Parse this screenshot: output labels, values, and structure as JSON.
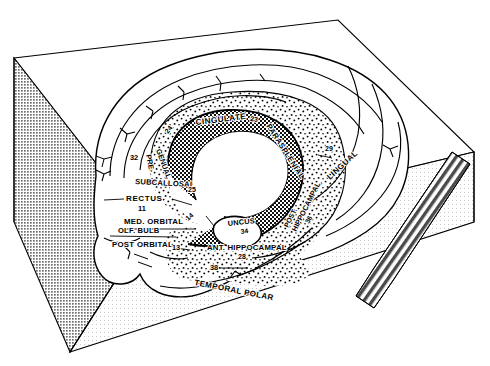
{
  "figure": {
    "kind": "anatomical-line-diagram",
    "view": "three-dimensional block with medial brain surface on top face",
    "colors": {
      "ink": "#000000",
      "paper": "#ffffff",
      "left_face_shade": "#9a9a9a",
      "right_face_shade": "#efefef",
      "top_face": "#ffffff",
      "stipple": "#000000",
      "crosshatch": "#000000"
    }
  },
  "block": {
    "left_face": "shaded-gray-wedge",
    "right_face": "light-gray-wedge",
    "top_face": "white",
    "stair_band": "diagonal-striped-ladder-band-on-right-face"
  },
  "legend_note": {
    "stipple_region": "limbic cortex (stippled)",
    "crosshatch_region": "periallocortex / corpus callosum border (cross-hatched)",
    "plain_region": "neocortex (unmarked)"
  },
  "labels": [
    {
      "id": "cingulate",
      "text": "CINGULATE",
      "x": 196,
      "y": 125,
      "rot": -7,
      "size": 8.2,
      "letter_spacing": 0.4
    },
    {
      "id": "area-24",
      "text": "24",
      "x": 168,
      "y": 134,
      "rot": -52,
      "size": 7.0
    },
    {
      "id": "area-23",
      "text": "23",
      "x": 250,
      "y": 121,
      "rot": 6,
      "size": 7.0
    },
    {
      "id": "parasplenial",
      "text": "PARASPLENIAL",
      "x": 266,
      "y": 126,
      "rot": 57,
      "size": 7.8,
      "letter_spacing": 0.3
    },
    {
      "id": "area-29",
      "text": "29",
      "x": 325,
      "y": 151,
      "rot": 0,
      "size": 7.0
    },
    {
      "id": "lingual",
      "text": "LINGUAL",
      "x": 330,
      "y": 180,
      "rot": -43,
      "size": 8.0,
      "letter_spacing": 0.4
    },
    {
      "id": "area-32",
      "text": "32",
      "x": 130,
      "y": 160,
      "rot": 0,
      "size": 7.4
    },
    {
      "id": "pre",
      "text": "PRE-",
      "x": 146,
      "y": 155,
      "rot": 79,
      "size": 7.4
    },
    {
      "id": "genual",
      "text": "GENUAL",
      "x": 156,
      "y": 150,
      "rot": 70,
      "size": 7.4
    },
    {
      "id": "subcallosal",
      "text": "SUBCALLOSAL",
      "x": 135,
      "y": 184,
      "rot": 3,
      "size": 7.6,
      "letter_spacing": 0.2
    },
    {
      "id": "area-25",
      "text": "25",
      "x": 188,
      "y": 192,
      "rot": 0,
      "size": 7.0
    },
    {
      "id": "rectus",
      "text": "RECTUS",
      "x": 126,
      "y": 201,
      "rot": 0,
      "size": 8.0,
      "letter_spacing": 0.6
    },
    {
      "id": "area-11",
      "text": "11",
      "x": 138,
      "y": 211,
      "rot": 0,
      "size": 7.4
    },
    {
      "id": "med-orbital",
      "text": "MED. ORBITAL",
      "x": 124,
      "y": 224,
      "rot": 0,
      "size": 7.8,
      "letter_spacing": 0.3
    },
    {
      "id": "area-14",
      "text": "14",
      "x": 188,
      "y": 221,
      "rot": -40,
      "size": 7.0
    },
    {
      "id": "olf-bulb",
      "text": "OLF. BULB",
      "x": 118,
      "y": 233,
      "rot": 0,
      "size": 7.6,
      "letter_spacing": 0.2
    },
    {
      "id": "post-orbital",
      "text": "POST ORBITAL",
      "x": 112,
      "y": 247,
      "rot": 0,
      "size": 7.8,
      "letter_spacing": 0.3
    },
    {
      "id": "area-13",
      "text": "13",
      "x": 172,
      "y": 250,
      "rot": 0,
      "size": 7.4
    },
    {
      "id": "uncus",
      "text": "UNCUS",
      "x": 228,
      "y": 226,
      "rot": -6,
      "size": 7.4,
      "letter_spacing": 0.2
    },
    {
      "id": "area-34",
      "text": "34",
      "x": 241,
      "y": 234,
      "rot": -8,
      "size": 6.8
    },
    {
      "id": "ant-hippocampal",
      "text": "ANT. HIPPOCAMPAL",
      "x": 207,
      "y": 250,
      "rot": 0,
      "size": 7.8,
      "letter_spacing": 0.2
    },
    {
      "id": "area-28",
      "text": "28",
      "x": 238,
      "y": 259,
      "rot": 0,
      "size": 7.0
    },
    {
      "id": "post",
      "text": "POST.",
      "x": 288,
      "y": 228,
      "rot": -63,
      "size": 7.0
    },
    {
      "id": "post-hippocampal",
      "text": "HIPPOCAMPAL",
      "x": 296,
      "y": 232,
      "rot": -63,
      "size": 7.4
    },
    {
      "id": "area-36",
      "text": "36",
      "x": 309,
      "y": 224,
      "rot": -63,
      "size": 6.8
    },
    {
      "id": "area-38",
      "text": "38",
      "x": 210,
      "y": 270,
      "rot": 0,
      "size": 7.4
    },
    {
      "id": "temporal-polar",
      "text": "TEMPORAL POLAR",
      "x": 194,
      "y": 285,
      "rot": 11,
      "size": 8.0,
      "letter_spacing": 0.4
    }
  ],
  "areas_index": {
    "11": "RECTUS",
    "13": "POST ORBITAL",
    "14": "MED. ORBITAL",
    "23": "CINGULATE (posterior)",
    "24": "CINGULATE (anterior)",
    "25": "SUBCALLOSAL",
    "28": "ANT. HIPPOCAMPAL",
    "29": "PARASPLENIAL",
    "32": "PRE-GENUAL",
    "34": "UNCUS",
    "36": "POST. HIPPOCAMPAL",
    "38": "TEMPORAL POLAR"
  }
}
